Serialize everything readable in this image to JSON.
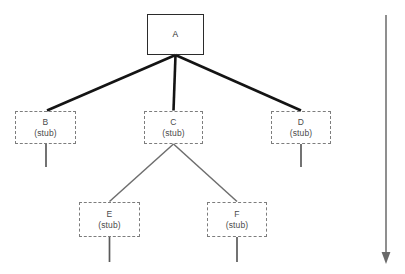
{
  "diagram": {
    "type": "tree",
    "background_color": "#ffffff",
    "colors": {
      "solid_node_border": "#2b2b2b",
      "dashed_node_border": "#7d7d7d",
      "primary_edge": "#141414",
      "secondary_edge": "#6e6e6e",
      "stub_line": "#5a5a5a",
      "arrow": "#6a6a6a",
      "text": "#3a3a3a"
    },
    "nodes": [
      {
        "id": "A",
        "label": "A",
        "sublabel": "",
        "style": "solid",
        "x": 147,
        "y": 14,
        "w": 57,
        "h": 41,
        "has_stub_line": false
      },
      {
        "id": "B",
        "label": "B",
        "sublabel": "(stub)",
        "style": "dashed",
        "x": 15,
        "y": 111,
        "w": 61,
        "h": 33,
        "has_stub_line": true
      },
      {
        "id": "C",
        "label": "C",
        "sublabel": "(stub)",
        "style": "dashed",
        "x": 144,
        "y": 111,
        "w": 59,
        "h": 33,
        "has_stub_line": false
      },
      {
        "id": "D",
        "label": "D",
        "sublabel": "(stub)",
        "style": "dashed",
        "x": 271,
        "y": 111,
        "w": 60,
        "h": 33,
        "has_stub_line": true
      },
      {
        "id": "E",
        "label": "E",
        "sublabel": "(stub)",
        "style": "dashed",
        "x": 79,
        "y": 202,
        "w": 61,
        "h": 35,
        "has_stub_line": true
      },
      {
        "id": "F",
        "label": "F",
        "sublabel": "(stub)",
        "style": "dashed",
        "x": 207,
        "y": 202,
        "w": 60,
        "h": 35,
        "has_stub_line": true
      }
    ],
    "edges": [
      {
        "from": "A",
        "to": "B",
        "weight": "thick"
      },
      {
        "from": "A",
        "to": "C",
        "weight": "thick"
      },
      {
        "from": "A",
        "to": "D",
        "weight": "thick"
      },
      {
        "from": "C",
        "to": "E",
        "weight": "thin"
      },
      {
        "from": "C",
        "to": "F",
        "weight": "thin"
      }
    ],
    "arrow": {
      "name": "downward-direction-arrow",
      "orientation": "down",
      "x": 386,
      "y_start": 15,
      "y_end": 262,
      "label": ""
    }
  }
}
